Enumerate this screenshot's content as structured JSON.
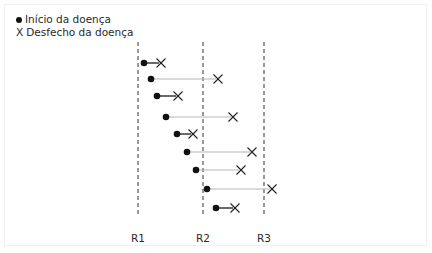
{
  "legend": {
    "items": [
      {
        "symbol": "dot-icon",
        "label": "Início da doença"
      },
      {
        "symbol": "x-icon",
        "glyph": "X",
        "label": "Desfecho da doença"
      }
    ]
  },
  "reference_lines": [
    {
      "label": "R1",
      "x": 138
    },
    {
      "label": "R2",
      "x": 203
    },
    {
      "label": "R3",
      "x": 264
    }
  ],
  "reference_line_range": {
    "y_top": 42,
    "y_bottom": 214
  },
  "colors": {
    "dot": "#111111",
    "x_mark": "#222222",
    "short_line": "#1a1a1a",
    "long_line": "#b5b5b5",
    "ref_line": "#333333"
  },
  "cases": [
    {
      "start_x": 144,
      "end_x": 161,
      "y": 63,
      "duration": "short"
    },
    {
      "start_x": 151,
      "end_x": 218,
      "y": 79,
      "duration": "long"
    },
    {
      "start_x": 157,
      "end_x": 178,
      "y": 96,
      "duration": "short"
    },
    {
      "start_x": 166,
      "end_x": 233,
      "y": 117,
      "duration": "long"
    },
    {
      "start_x": 177,
      "end_x": 193,
      "y": 134,
      "duration": "short"
    },
    {
      "start_x": 187,
      "end_x": 252,
      "y": 152,
      "duration": "long"
    },
    {
      "start_x": 196,
      "end_x": 241,
      "y": 170,
      "duration": "long"
    },
    {
      "start_x": 207,
      "end_x": 272,
      "y": 189,
      "duration": "long"
    },
    {
      "start_x": 216,
      "end_x": 235,
      "y": 208,
      "duration": "short"
    }
  ]
}
